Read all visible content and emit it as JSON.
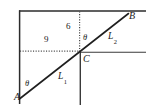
{
  "figure": {
    "type": "geometry-diagram",
    "background_color": "#ffffff",
    "stroke_color": "#262626",
    "dotted_color": "#4d4d4d"
  },
  "points": {
    "a": {
      "label": "A",
      "x": 14,
      "y": 92
    },
    "b": {
      "label": "B",
      "x": 129,
      "y": 11
    },
    "c": {
      "label": "C",
      "x": 83,
      "y": 54
    }
  },
  "lines": {
    "l1": {
      "label": "L",
      "subscript": "1",
      "x": 58,
      "y": 72
    },
    "l2": {
      "label": "L",
      "subscript": "2",
      "x": 108,
      "y": 32
    }
  },
  "angles": [
    {
      "name": "theta-at-a",
      "label": "θ",
      "x": 25,
      "y": 79
    },
    {
      "name": "theta-at-c",
      "label": "θ",
      "x": 83,
      "y": 33
    }
  ],
  "measurements": [
    {
      "name": "horizontal-run",
      "label": "9",
      "value": 9,
      "x": 44,
      "y": 35
    },
    {
      "name": "vertical-rise",
      "label": "6",
      "value": 6,
      "x": 66,
      "y": 22
    }
  ],
  "geometry": {
    "frame_top_y": 11,
    "frame_left_x": 19,
    "frame_bottom_y": 104,
    "frame_right_x": 146,
    "diagonal_from": [
      20,
      98
    ],
    "diagonal_to": [
      128,
      14
    ],
    "c_point": [
      80,
      52
    ],
    "horizontal_line_y": 52,
    "vertical_line_x": 80
  }
}
